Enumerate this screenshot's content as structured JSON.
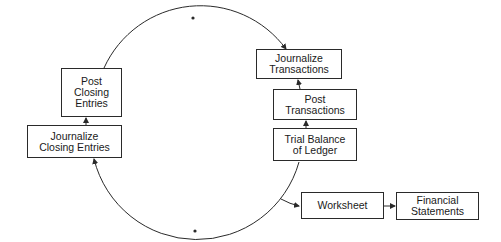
{
  "diagram": {
    "title": "",
    "nodes": {
      "post_closing": "Post\nClosing\nEntries",
      "journalize_closing": "Journalize\nClosing Entries",
      "journalize_transactions": "Journalize\nTransactions",
      "post_transactions": "Post\nTransactions",
      "trial_balance": "Trial Balance\nof Ledger",
      "worksheet": "Worksheet",
      "financial_statements": "Financial\nStatements"
    },
    "edges": [
      {
        "from": "Journalize Transactions",
        "to": "Post Transactions"
      },
      {
        "from": "Post Transactions",
        "to": "Trial Balance of Ledger"
      },
      {
        "from": "Trial Balance of Ledger",
        "to": "Journalize Closing Entries"
      },
      {
        "from": "Trial Balance of Ledger",
        "to": "Worksheet"
      },
      {
        "from": "Worksheet",
        "to": "Financial Statements"
      },
      {
        "from": "Journalize Closing Entries",
        "to": "Post Closing Entries"
      },
      {
        "from": "Post Closing Entries",
        "to": "Journalize Transactions"
      }
    ],
    "colors": {
      "line": "#2a2a2a",
      "background": "#ffffff"
    }
  }
}
